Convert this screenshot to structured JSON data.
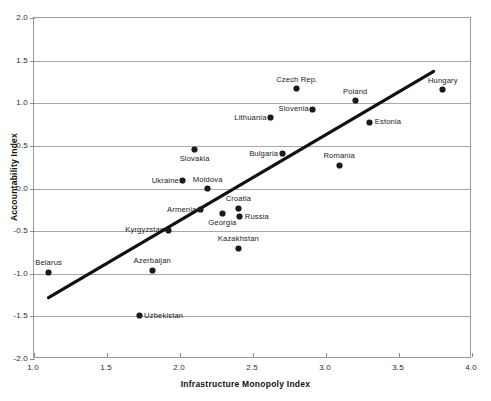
{
  "chart_data": {
    "type": "scatter",
    "title": "",
    "xlabel": "Infrastructure Monopoly Index",
    "ylabel": "Accountability Index",
    "xlim": [
      1.0,
      4.0
    ],
    "ylim": [
      -2.0,
      2.0
    ],
    "xticks": [
      "1.0",
      "1.5",
      "2.0",
      "2.5",
      "3.0",
      "3.5",
      "4.0"
    ],
    "xtick_values": [
      1.0,
      1.5,
      2.0,
      2.5,
      3.0,
      3.5,
      4.0
    ],
    "yticks": [
      "2.0",
      "1.5",
      "1.0",
      "0.5",
      "0.0",
      "-0.5",
      "-1.0",
      "-1.5",
      "-2.0"
    ],
    "ytick_values": [
      2.0,
      1.5,
      1.0,
      0.5,
      0.0,
      -0.5,
      -1.0,
      -1.5,
      -2.0
    ],
    "grid": "horizontal",
    "legend": "none",
    "marker_color": "#1b1b1b",
    "gridline_color": "#a8a8a8",
    "trendline_color": "#111111",
    "trendline": {
      "label": "linear fit",
      "x0": 1.1,
      "y0": -1.3,
      "x1": 3.75,
      "y1": 1.37
    },
    "points": [
      {
        "name": "Belarus",
        "x": 1.1,
        "y": -0.98,
        "label_pos": "above"
      },
      {
        "name": "Uzbekistan",
        "x": 1.72,
        "y": -1.49,
        "label_pos": "right"
      },
      {
        "name": "Azerbaijan",
        "x": 1.81,
        "y": -0.96,
        "label_pos": "above"
      },
      {
        "name": "Kyrgyzstan",
        "x": 1.92,
        "y": -0.49,
        "label_pos": "left"
      },
      {
        "name": "Slovakia",
        "x": 2.1,
        "y": 0.46,
        "label_pos": "below"
      },
      {
        "name": "Ukraine",
        "x": 2.02,
        "y": 0.09,
        "label_pos": "left"
      },
      {
        "name": "Armenia",
        "x": 2.14,
        "y": -0.25,
        "label_pos": "left"
      },
      {
        "name": "Moldova",
        "x": 2.19,
        "y": 0.0,
        "label_pos": "above"
      },
      {
        "name": "Georgia",
        "x": 2.29,
        "y": -0.29,
        "label_pos": "below"
      },
      {
        "name": "Croatia",
        "x": 2.4,
        "y": -0.23,
        "label_pos": "above"
      },
      {
        "name": "Russia",
        "x": 2.41,
        "y": -0.33,
        "label_pos": "right"
      },
      {
        "name": "Kazakhstan",
        "x": 2.4,
        "y": -0.7,
        "label_pos": "above"
      },
      {
        "name": "Lithuania",
        "x": 2.62,
        "y": 0.83,
        "label_pos": "left"
      },
      {
        "name": "Bulgaria",
        "x": 2.7,
        "y": 0.41,
        "label_pos": "left"
      },
      {
        "name": "Slovenia",
        "x": 2.91,
        "y": 0.93,
        "label_pos": "left"
      },
      {
        "name": "Czech Rep.",
        "x": 2.8,
        "y": 1.17,
        "label_pos": "above"
      },
      {
        "name": "Romania",
        "x": 3.09,
        "y": 0.27,
        "label_pos": "above"
      },
      {
        "name": "Poland",
        "x": 3.2,
        "y": 1.03,
        "label_pos": "above"
      },
      {
        "name": "Estonia",
        "x": 3.3,
        "y": 0.78,
        "label_pos": "right"
      },
      {
        "name": "Hungary",
        "x": 3.8,
        "y": 1.16,
        "label_pos": "above"
      }
    ]
  }
}
